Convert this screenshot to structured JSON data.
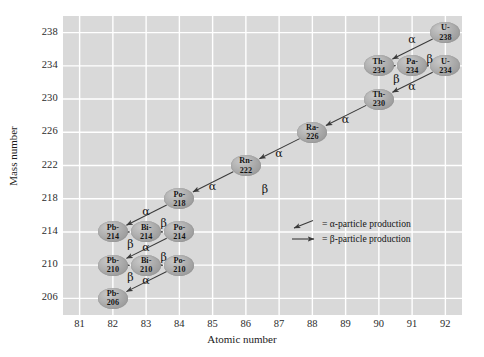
{
  "chart_data": {
    "type": "scatter",
    "title": "",
    "xlabel": "Atomic number",
    "ylabel": "Mass number",
    "xlim": [
      80.5,
      92.5
    ],
    "ylim": [
      204,
      240
    ],
    "xticks": [
      81,
      82,
      83,
      84,
      85,
      86,
      87,
      88,
      89,
      90,
      91,
      92
    ],
    "yticks": [
      206,
      210,
      214,
      218,
      222,
      226,
      230,
      234,
      238
    ],
    "grid": true,
    "legend_position": "inside-right-middle",
    "nodes": [
      {
        "id": "U-238",
        "element": "U",
        "mass": 238,
        "z": 92,
        "label_top": "U-",
        "label_bottom": "238"
      },
      {
        "id": "Th-234",
        "element": "Th",
        "mass": 234,
        "z": 90,
        "label_top": "Th-",
        "label_bottom": "234"
      },
      {
        "id": "Pa-234",
        "element": "Pa",
        "mass": 234,
        "z": 91,
        "label_top": "Pa-",
        "label_bottom": "234"
      },
      {
        "id": "U-234",
        "element": "U",
        "mass": 234,
        "z": 92,
        "label_top": "U-",
        "label_bottom": "234"
      },
      {
        "id": "Th-230",
        "element": "Th",
        "mass": 230,
        "z": 90,
        "label_top": "Th-",
        "label_bottom": "230"
      },
      {
        "id": "Ra-226",
        "element": "Ra",
        "mass": 226,
        "z": 88,
        "label_top": "Ra-",
        "label_bottom": "226"
      },
      {
        "id": "Rn-222",
        "element": "Rn",
        "mass": 222,
        "z": 86,
        "label_top": "Rn-",
        "label_bottom": "222"
      },
      {
        "id": "Po-218",
        "element": "Po",
        "mass": 218,
        "z": 84,
        "label_top": "Po-",
        "label_bottom": "218"
      },
      {
        "id": "Pb-214",
        "element": "Pb",
        "mass": 214,
        "z": 82,
        "label_top": "Pb-",
        "label_bottom": "214"
      },
      {
        "id": "Bi-214",
        "element": "Bi",
        "mass": 214,
        "z": 83,
        "label_top": "Bi-",
        "label_bottom": "214"
      },
      {
        "id": "Po-214",
        "element": "Po",
        "mass": 214,
        "z": 84,
        "label_top": "Po-",
        "label_bottom": "214"
      },
      {
        "id": "Pb-210",
        "element": "Pb",
        "mass": 210,
        "z": 82,
        "label_top": "Pb-",
        "label_bottom": "210"
      },
      {
        "id": "Bi-210",
        "element": "Bi",
        "mass": 210,
        "z": 83,
        "label_top": "Bi-",
        "label_bottom": "210"
      },
      {
        "id": "Po-210",
        "element": "Po",
        "mass": 210,
        "z": 84,
        "label_top": "Po-",
        "label_bottom": "210"
      },
      {
        "id": "Pb-206",
        "element": "Pb",
        "mass": 206,
        "z": 82,
        "label_top": "Pb-",
        "label_bottom": "206"
      }
    ],
    "decays": [
      {
        "from": "U-238",
        "to": "Th-234",
        "type": "alpha",
        "label": "α"
      },
      {
        "from": "Th-234",
        "to": "Pa-234",
        "type": "beta",
        "label": "β"
      },
      {
        "from": "Pa-234",
        "to": "U-234",
        "type": "beta",
        "label": "β"
      },
      {
        "from": "U-234",
        "to": "Th-230",
        "type": "alpha",
        "label": "α"
      },
      {
        "from": "Th-230",
        "to": "Ra-226",
        "type": "alpha",
        "label": "α"
      },
      {
        "from": "Ra-226",
        "to": "Rn-222",
        "type": "alpha",
        "label": "α"
      },
      {
        "from": "Rn-222",
        "to": "Po-218",
        "type": "alpha",
        "label": "α"
      },
      {
        "from": "Po-218",
        "to": "Pb-214",
        "type": "alpha",
        "label": "α"
      },
      {
        "from": "Pb-214",
        "to": "Bi-214",
        "type": "beta",
        "label": "β"
      },
      {
        "from": "Bi-214",
        "to": "Po-214",
        "type": "beta",
        "label": "β"
      },
      {
        "from": "Po-214",
        "to": "Pb-210",
        "type": "alpha",
        "label": "α"
      },
      {
        "from": "Pb-210",
        "to": "Bi-210",
        "type": "beta",
        "label": "β"
      },
      {
        "from": "Bi-210",
        "to": "Po-210",
        "type": "beta",
        "label": "β"
      },
      {
        "from": "Po-210",
        "to": "Pb-206",
        "type": "alpha",
        "label": "α"
      }
    ],
    "annotations": [
      {
        "text": "α",
        "x": 91.0,
        "y": 237.0
      },
      {
        "text": "β",
        "x": 90.55,
        "y": 232.2
      },
      {
        "text": "β",
        "x": 91.55,
        "y": 234.6
      },
      {
        "text": "α",
        "x": 91.0,
        "y": 231.3
      },
      {
        "text": "α",
        "x": 89.0,
        "y": 227.3
      },
      {
        "text": "α",
        "x": 87.0,
        "y": 223.3
      },
      {
        "text": "α",
        "x": 85.0,
        "y": 219.3
      },
      {
        "text": "α",
        "x": 83.0,
        "y": 216.3
      },
      {
        "text": "β",
        "x": 82.55,
        "y": 212.3
      },
      {
        "text": "β",
        "x": 83.55,
        "y": 214.8
      },
      {
        "text": "α",
        "x": 83.0,
        "y": 212.0
      },
      {
        "text": "β",
        "x": 82.55,
        "y": 208.3
      },
      {
        "text": "β",
        "x": 83.55,
        "y": 210.8
      },
      {
        "text": "α",
        "x": 83.0,
        "y": 208.0
      },
      {
        "text": "β",
        "x": 86.6,
        "y": 218.9
      }
    ]
  },
  "legend": {
    "alpha": {
      "key": "alpha-arrow-icon",
      "text": "= α-particle production"
    },
    "beta": {
      "key": "beta-arrow-icon",
      "text": "= β-particle production"
    }
  },
  "colors": {
    "plot_background": "#d9d9d9",
    "grid": "#ffffff",
    "node_fill": "#a8a8a8",
    "text": "#1a1a1a",
    "arrow": "#3a3a3a"
  }
}
